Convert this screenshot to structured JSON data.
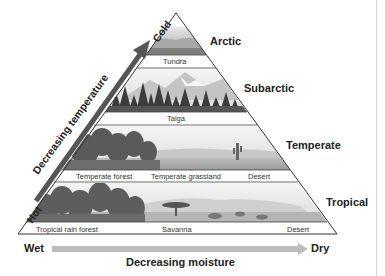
{
  "diagram": {
    "type": "biome-pyramid",
    "zones": [
      {
        "name": "Arctic",
        "biomes": [
          "Tundra"
        ]
      },
      {
        "name": "Subarctic",
        "biomes": [
          "Taiga"
        ]
      },
      {
        "name": "Temperate",
        "biomes": [
          "Temperate forest",
          "Temperate grassland",
          "Desert"
        ]
      },
      {
        "name": "Tropical",
        "biomes": [
          "Tropical rain forest",
          "Savanna",
          "Desert"
        ]
      }
    ],
    "temperature_axis": {
      "low_end": "Cold",
      "high_end": "Hot",
      "title": "Decreasing temperature"
    },
    "moisture_axis": {
      "start": "Wet",
      "end": "Dry",
      "title": "Decreasing moisture"
    },
    "colors": {
      "temp_arrow": "#555555",
      "moisture_arrow": "#bdbdbd",
      "outline": "#333333"
    }
  }
}
